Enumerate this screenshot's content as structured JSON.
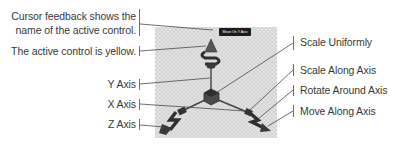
{
  "diagram": {
    "type": "3D transform gizmo annotation",
    "left_labels": [
      {
        "id": "cursor-feedback",
        "lines": [
          "Cursor feedback shows the",
          "name of the active control."
        ]
      },
      {
        "id": "active-yellow",
        "lines": [
          "The active control is yellow."
        ]
      },
      {
        "id": "y-axis",
        "lines": [
          "Y Axis"
        ]
      },
      {
        "id": "x-axis",
        "lines": [
          "X Axis"
        ]
      },
      {
        "id": "z-axis",
        "lines": [
          "Z Axis"
        ]
      }
    ],
    "right_labels": [
      {
        "id": "scale-uniformly",
        "text": "Scale Uniformly"
      },
      {
        "id": "scale-along-axis",
        "text": "Scale Along Axis"
      },
      {
        "id": "rotate-around-axis",
        "text": "Rotate Around Axis"
      },
      {
        "id": "move-along-axis",
        "text": "Move Along Axis"
      }
    ],
    "tooltip": "Move On Y Axis",
    "colors": {
      "label_text": "#3a3a3a",
      "leader_line": "#4a4a4a",
      "checker_light": "#e4e4e4",
      "checker_dark": "#d2d2d2",
      "gizmo": "#3c3c3c",
      "tooltip_bg": "#1b1b1b"
    }
  }
}
